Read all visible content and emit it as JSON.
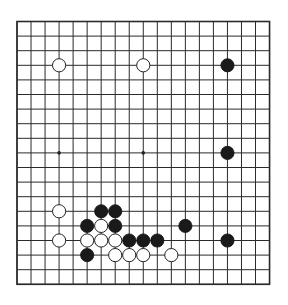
{
  "board": {
    "size": 19,
    "origin_x": 17,
    "origin_y": 21.5,
    "spacing_x": 14.03,
    "spacing_y": 14.6,
    "stone_radius": 6.6,
    "colors": {
      "background": "#ffffff",
      "line": "#2b2b2b",
      "black_stone": "#1a1a1a",
      "white_stone": "#ffffff"
    },
    "star_points": [
      [
        3,
        3
      ],
      [
        9,
        3
      ],
      [
        15,
        3
      ],
      [
        3,
        9
      ],
      [
        9,
        9
      ],
      [
        15,
        9
      ],
      [
        3,
        15
      ],
      [
        9,
        15
      ],
      [
        15,
        15
      ]
    ]
  },
  "stones": {
    "black": [
      [
        15,
        3
      ],
      [
        15,
        9
      ],
      [
        6,
        13
      ],
      [
        7,
        13
      ],
      [
        5,
        14
      ],
      [
        7,
        14
      ],
      [
        12,
        14
      ],
      [
        8,
        15
      ],
      [
        9,
        15
      ],
      [
        10,
        15
      ],
      [
        15,
        15
      ],
      [
        5,
        16
      ]
    ],
    "white": [
      [
        3,
        3
      ],
      [
        9,
        3
      ],
      [
        3,
        13
      ],
      [
        6,
        14
      ],
      [
        3,
        15
      ],
      [
        5,
        15
      ],
      [
        6,
        15
      ],
      [
        7,
        15
      ],
      [
        7,
        16
      ],
      [
        8,
        16
      ],
      [
        9,
        16
      ],
      [
        11,
        16
      ]
    ]
  }
}
